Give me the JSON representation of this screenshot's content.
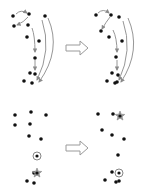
{
  "figure": {
    "colors": {
      "dot": "#111111",
      "arrow": "#8a8a8a",
      "marker": "#777777",
      "transform_arrow": "#9a9a9a"
    }
  },
  "top_row": {
    "before": {
      "dots": [
        [
          13,
          16
        ],
        [
          29,
          14
        ],
        [
          45,
          16
        ],
        [
          14,
          26
        ],
        [
          28,
          25
        ],
        [
          27,
          37
        ],
        [
          39,
          41
        ],
        [
          35,
          58
        ],
        [
          30,
          73
        ],
        [
          35,
          74
        ],
        [
          24,
          81
        ],
        [
          32,
          83
        ]
      ],
      "arrows": [
        {
          "path": "M16,14 Q21,9 27,13"
        },
        {
          "path": "M28,17 Q24,22 17,25"
        },
        {
          "path": "M32,28 Q35,36 35,52"
        },
        {
          "path": "M35,60 L35,70"
        },
        {
          "path": "M42,20 Q52,50 37,80"
        },
        {
          "path": "M48,18 Q62,50 39,82"
        }
      ]
    },
    "transform_arrow": "right",
    "after": {
      "dots": [
        [
          96,
          15
        ],
        [
          111,
          15
        ],
        [
          119,
          17
        ],
        [
          101,
          31
        ],
        [
          109,
          37
        ],
        [
          122,
          41
        ],
        [
          116,
          57
        ],
        [
          112,
          73
        ],
        [
          118,
          75
        ],
        [
          107,
          81
        ],
        [
          115,
          83
        ],
        [
          117,
          82
        ]
      ],
      "arrows": [
        {
          "path": "M98,13 Q103,8 109,13"
        },
        {
          "path": "M110,17 Q106,22 102,29"
        },
        {
          "path": "M113,30 Q117,38 117,52"
        },
        {
          "path": "M117,60 L117,70"
        },
        {
          "path": "M123,21 Q133,50 119,80"
        },
        {
          "path": "M128,18 Q142,50 121,82"
        }
      ]
    }
  },
  "bottom_row": {
    "before": {
      "dots": [
        [
          15,
          115
        ],
        [
          31,
          112
        ],
        [
          46,
          115
        ],
        [
          15,
          125
        ],
        [
          30,
          124
        ],
        [
          29,
          136
        ],
        [
          41,
          139
        ],
        [
          34,
          173
        ],
        [
          27,
          181
        ],
        [
          34,
          183
        ]
      ],
      "circle_marker": [
        37,
        156
      ],
      "star_marker": [
        37,
        173
      ]
    },
    "transform_arrow": "right",
    "after": {
      "dots": [
        [
          98,
          114
        ],
        [
          113,
          114
        ],
        [
          102,
          130
        ],
        [
          112,
          135
        ],
        [
          124,
          139
        ],
        [
          118,
          155
        ],
        [
          112,
          172
        ],
        [
          105,
          180
        ],
        [
          116,
          182
        ],
        [
          119,
          181
        ]
      ],
      "star_marker": [
        120,
        116
      ],
      "circle_marker": [
        119,
        173
      ]
    }
  }
}
